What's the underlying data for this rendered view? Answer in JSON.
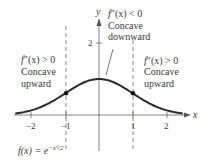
{
  "chart_data": {
    "type": "line",
    "title": "",
    "function_label": "f(x) = e^{-x^2/2}",
    "xlabel": "x",
    "ylabel": "y",
    "xlim": [
      -2.5,
      2.5
    ],
    "ylim": [
      0,
      2.6
    ],
    "x_ticks": [
      -2,
      -1,
      1,
      2
    ],
    "x_tick_labels": [
      "−2",
      "−1",
      "1",
      "2"
    ],
    "y_ticks": [
      2
    ],
    "y_tick_labels": [
      "2"
    ],
    "grid": false,
    "series": [
      {
        "name": "f(x) = e^(-x^2/2)",
        "x": [
          -2.5,
          -2,
          -1.5,
          -1,
          -0.5,
          0,
          0.5,
          1,
          1.5,
          2,
          2.5
        ],
        "values": [
          0.044,
          0.135,
          0.325,
          0.607,
          0.882,
          1.0,
          0.882,
          0.607,
          0.325,
          0.135,
          0.044
        ]
      }
    ],
    "inflection_points": [
      {
        "x": -1,
        "y": 0.607
      },
      {
        "x": 1,
        "y": 0.607
      }
    ],
    "vertical_dashed_lines": [
      -1,
      1
    ],
    "annotations": [
      {
        "region": "left",
        "condition": "f″(x) > 0",
        "line1": "Concave",
        "line2": "upward"
      },
      {
        "region": "middle",
        "condition": "f″(x) < 0",
        "line1": "Concave",
        "line2": "downward"
      },
      {
        "region": "right",
        "condition": "f″(x) > 0",
        "line1": "Concave",
        "line2": "upward"
      }
    ]
  },
  "axes": {
    "x_label": "x",
    "y_label": "y",
    "x_ticks": [
      "−2",
      "−1",
      "1",
      "2"
    ],
    "y_tick": "2"
  },
  "annotations": {
    "left": {
      "cond_f": "f",
      "cond_rest": "″(x) > 0",
      "line1": "Concave",
      "line2": "upward"
    },
    "middle": {
      "cond_f": "f",
      "cond_rest": "″(x) < 0",
      "line1": "Concave",
      "line2": "downward"
    },
    "right": {
      "cond_f": "f",
      "cond_rest": "″(x) > 0",
      "line1": "Concave",
      "line2": "upward"
    }
  },
  "formula": {
    "lhs": "f(x) = e",
    "exponent": "−x²/2"
  },
  "colors": {
    "curve": "#2b2b2b",
    "axis": "#555555",
    "dashed": "#666666",
    "text": "#3a3a3a"
  }
}
